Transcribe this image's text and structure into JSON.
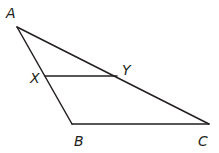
{
  "diagram": {
    "type": "triangle",
    "stroke_color": "#231f20",
    "background": "#ffffff",
    "vertices": {
      "A": {
        "label": "A",
        "x": 17,
        "y": 27,
        "label_x": 6,
        "label_y": 18
      },
      "B": {
        "label": "B",
        "x": 72,
        "y": 124,
        "label_x": 74,
        "label_y": 146
      },
      "C": {
        "label": "C",
        "x": 209,
        "y": 124,
        "label_x": 198,
        "label_y": 146
      },
      "X": {
        "label": "X",
        "x": 45,
        "y": 76,
        "label_x": 30,
        "label_y": 83
      },
      "Y": {
        "label": "Y",
        "x": 117,
        "y": 76,
        "label_x": 122,
        "label_y": 75
      }
    },
    "segments": [
      {
        "from": "A",
        "to": "B"
      },
      {
        "from": "B",
        "to": "C"
      },
      {
        "from": "A",
        "to": "C"
      },
      {
        "from": "X",
        "to": "Y"
      }
    ],
    "note": "Segment XY is parallel to BC"
  }
}
